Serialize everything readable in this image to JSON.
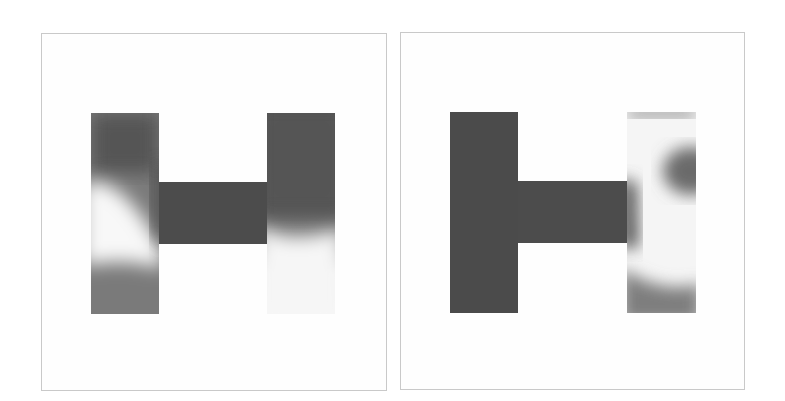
{
  "figure": {
    "panels": [
      {
        "name": "left-field-plot",
        "shape": "H-shaped domain",
        "dark_color": "#4a4a4a",
        "light_color": "#f7f7f7"
      },
      {
        "name": "right-field-plot",
        "shape": "H-shaped domain",
        "dark_color": "#4a4a4a",
        "light_color": "#f7f7f7"
      }
    ]
  }
}
